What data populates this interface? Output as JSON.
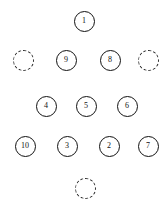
{
  "diagram": {
    "type": "node-graph",
    "background_color": "#ffffff",
    "node_stroke_color": "#111111",
    "node_fill_color": "#ffffff",
    "filled_node_diameter": 21,
    "empty_node_diameter": 21,
    "nodes": [
      {
        "label": "1",
        "state": "filled",
        "cx": 84,
        "cy": 21
      },
      {
        "label": "",
        "state": "empty",
        "cx": 23,
        "cy": 60
      },
      {
        "label": "9",
        "state": "filled",
        "cx": 66,
        "cy": 60
      },
      {
        "label": "8",
        "state": "filled",
        "cx": 110,
        "cy": 60
      },
      {
        "label": "",
        "state": "empty",
        "cx": 148,
        "cy": 60
      },
      {
        "label": "4",
        "state": "filled",
        "cx": 46,
        "cy": 106
      },
      {
        "label": "5",
        "state": "filled",
        "cx": 86,
        "cy": 106
      },
      {
        "label": "6",
        "state": "filled",
        "cx": 127,
        "cy": 106
      },
      {
        "label": "10",
        "state": "filled",
        "cx": 25,
        "cy": 146
      },
      {
        "label": "3",
        "state": "filled",
        "cx": 67,
        "cy": 146
      },
      {
        "label": "2",
        "state": "filled",
        "cx": 109,
        "cy": 146
      },
      {
        "label": "7",
        "state": "filled",
        "cx": 148,
        "cy": 146
      },
      {
        "label": "",
        "state": "empty",
        "cx": 85,
        "cy": 188
      }
    ]
  }
}
